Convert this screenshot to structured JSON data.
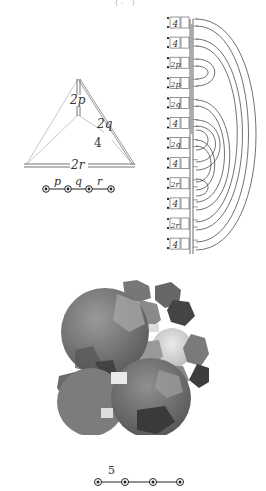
{
  "figure": {
    "top_fragment": "(·,·)",
    "tetrahedron": {
      "edge_labels": {
        "vertical": "2p",
        "right": "2q",
        "inner": "4",
        "base": "2r"
      },
      "coxeter_diagram": {
        "nodes": 4,
        "ringed": true,
        "branch_labels": [
          "p",
          "q",
          "r"
        ]
      }
    },
    "graph_diagram": {
      "row_labels": [
        "4",
        "4",
        "2p",
        "2p",
        "2q",
        "4",
        "2q",
        "4",
        "2r",
        "4",
        "2r",
        "4"
      ]
    },
    "polytope_render": {
      "description": "shaded 3D projection of uniform polytope cells"
    },
    "bottom_coxeter_diagram": {
      "nodes": 4,
      "ringed": true,
      "branch_labels": [
        "5",
        "",
        ""
      ]
    }
  },
  "colors": {
    "line": "#333333",
    "light_line": "#bbbbbb",
    "cell_dark": "#3c3c3c",
    "cell_mid": "#7a7a7a",
    "cell_light": "#d8d8d8"
  }
}
